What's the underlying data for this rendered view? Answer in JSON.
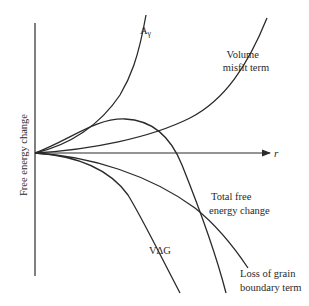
{
  "diagram": {
    "y_axis_label": "Free energy change",
    "x_axis_label": "r",
    "curves": [
      {
        "id": "surface",
        "label": "Aγ",
        "label_main": "A",
        "label_sub": "γ"
      },
      {
        "id": "volume_misfit",
        "label_line1": "Volume",
        "label_line2": "misfit term"
      },
      {
        "id": "total",
        "label_line1": "Total free",
        "label_line2": "energy change"
      },
      {
        "id": "volume_free_energy",
        "label": "VΔG"
      },
      {
        "id": "grain_boundary_loss",
        "label_line1": "Loss of grain",
        "label_line2": "boundary term"
      }
    ]
  }
}
